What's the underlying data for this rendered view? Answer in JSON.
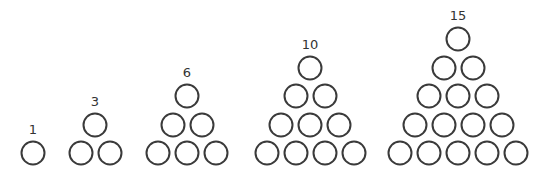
{
  "diagram": {
    "style": {
      "stroke_color": "#3a3a3a",
      "label_color": "#333333",
      "background": "#ffffff"
    },
    "groups": [
      {
        "label": "1",
        "rows": 1,
        "count": 1
      },
      {
        "label": "3",
        "rows": 2,
        "count": 3
      },
      {
        "label": "6",
        "rows": 3,
        "count": 6
      },
      {
        "label": "10",
        "rows": 4,
        "count": 10
      },
      {
        "label": "15",
        "rows": 5,
        "count": 15
      }
    ]
  }
}
